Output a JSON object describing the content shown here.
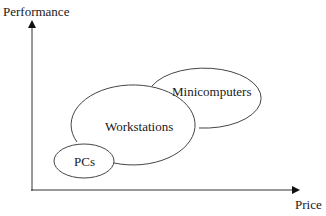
{
  "axes": {
    "y_label": "Performance",
    "x_label": "Price"
  },
  "regions": [
    {
      "label": "PCs",
      "cx": 84,
      "cy": 161,
      "rx": 30,
      "ry": 17
    },
    {
      "label": "Workstations",
      "cx": 137,
      "cy": 126,
      "rx": 62,
      "ry": 40
    },
    {
      "label": "Minicomputers",
      "cx": 204,
      "cy": 100,
      "rx": 57,
      "ry": 30
    }
  ],
  "colors": {
    "stroke": "#333333",
    "text": "#1a1a1a",
    "background": "#ffffff"
  }
}
